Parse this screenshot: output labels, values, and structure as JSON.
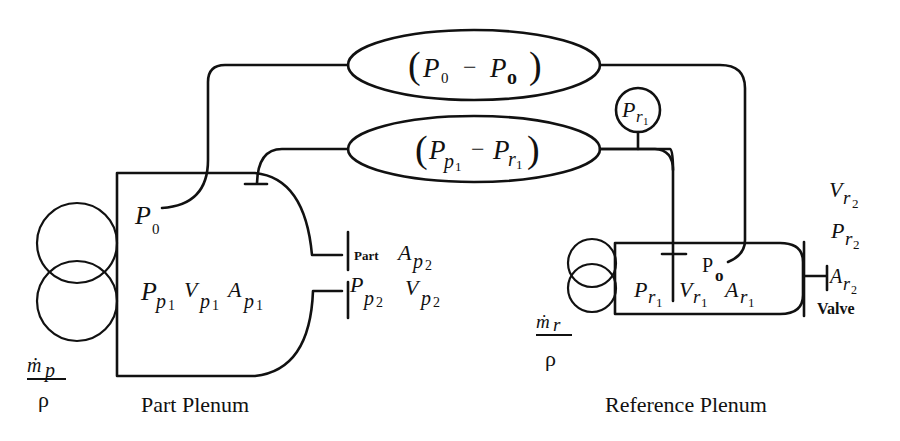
{
  "diagram": {
    "type": "pneumatic-pressure-decay-schematic",
    "part_plenum": {
      "title": "Part Plenum",
      "inlet_flow": {
        "numerator": "ṁp",
        "numerator_base": "ṁ",
        "numerator_sub": "p",
        "denominator": "ρ"
      },
      "tap_label": {
        "base": "P",
        "sub": "0"
      },
      "state_labels": [
        {
          "base": "P",
          "sub": "p",
          "subsub": "1"
        },
        {
          "base": "V",
          "sub": "p",
          "subsub": "1"
        },
        {
          "base": "A",
          "sub": "p",
          "subsub": "1"
        }
      ],
      "outlet": {
        "part_prefix": "Part",
        "area": {
          "base": "A",
          "sub": "p",
          "subsub": "2"
        },
        "pressure": {
          "base": "P",
          "sub": "p",
          "subsub": "2"
        },
        "volume": {
          "base": "V",
          "sub": "p",
          "subsub": "2"
        }
      }
    },
    "reference_plenum": {
      "title": "Reference Plenum",
      "inlet_flow": {
        "numerator": "ṁr",
        "numerator_base": "ṁ",
        "numerator_sub": "r",
        "denominator": "ρ"
      },
      "tap_label": {
        "base": "P",
        "sub": "o"
      },
      "state_labels": [
        {
          "base": "P",
          "sub": "r",
          "subsub": "1"
        },
        {
          "base": "V",
          "sub": "r",
          "subsub": "1"
        },
        {
          "base": "A",
          "sub": "r",
          "subsub": "1"
        }
      ],
      "outlet": {
        "volume": {
          "base": "V",
          "sub": "r",
          "subsub": "2"
        },
        "pressure": {
          "base": "P",
          "sub": "r",
          "subsub": "2"
        },
        "area": {
          "base": "A",
          "sub": "r",
          "subsub": "2"
        },
        "valve_label": "Valve"
      }
    },
    "sensors": {
      "differential_top": {
        "open": "(",
        "a_base": "P",
        "a_sub": "0",
        "minus": "−",
        "b_base": "P",
        "b_sub": "o",
        "close": ")"
      },
      "differential_bottom": {
        "open": "(",
        "a_base": "P",
        "a_sub": "p",
        "a_subsub": "1",
        "minus": "−",
        "b_base": "P",
        "b_sub": "r",
        "b_subsub": "1",
        "close": ")"
      },
      "gauge": {
        "base": "P",
        "sub": "r",
        "subsub": "1"
      }
    }
  }
}
